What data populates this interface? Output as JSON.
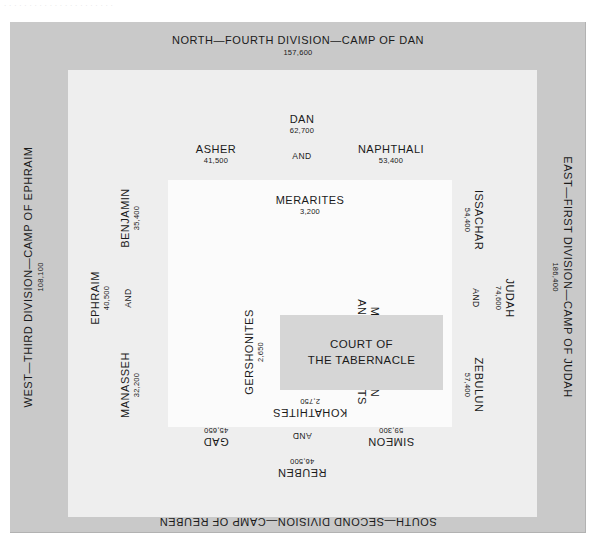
{
  "top_strip_artifact": "· · ·   ·  ·   ·  ·    ·   ·  ·        ·   ·    ·   ·   ·  ·      ·  ·   ·   ·       · ·",
  "divisions": {
    "north": {
      "label": "NORTH—FOURTH DIVISION—CAMP OF DAN",
      "total": "157,600"
    },
    "east": {
      "label": "EAST—FIRST DIVISION—CAMP OF JUDAH",
      "total": "186,400"
    },
    "south": {
      "label": "SOUTH—SECOND DIVISION—CAMP OF REUBEN",
      "total": "151,450"
    },
    "west": {
      "label": "WEST—THIRD DIVISION—CAMP OF EPHRAIM",
      "total": "108,100"
    }
  },
  "tribes": {
    "dan": {
      "name": "DAN",
      "count": "62,700"
    },
    "asher": {
      "name": "ASHER",
      "count": "41,500"
    },
    "naphtali": {
      "name": "NAPHTHALI",
      "count": "53,400"
    },
    "issachar": {
      "name": "ISSACHAR",
      "count": "54,400"
    },
    "judah": {
      "name": "JUDAH",
      "count": "74,600"
    },
    "zebulun": {
      "name": "ZEBULUN",
      "count": "57,400"
    },
    "gad": {
      "name": "GAD",
      "count": "45,650"
    },
    "reuben": {
      "name": "REUBEN",
      "count": "46,500"
    },
    "simeon": {
      "name": "SIMEON",
      "count": "59,300"
    },
    "benjamin": {
      "name": "BENJAMIN",
      "count": "35,400"
    },
    "ephraim": {
      "name": "EPHRAIM",
      "count": "40,500"
    },
    "manasseh": {
      "name": "MANASSEH",
      "count": "32,200"
    }
  },
  "levites": {
    "merarites": {
      "name": "MERARITES",
      "count": "3,200"
    },
    "gershonites": {
      "name": "GERSHONITES",
      "count": "2,650"
    },
    "kohathites": {
      "name": "KOHATHITES",
      "count": "2,750"
    },
    "priests": {
      "line1": "MOSES, AARON",
      "line2": "AND THE PRIESTS"
    }
  },
  "center": {
    "line1": "COURT OF",
    "line2": "THE TABERNACLE"
  },
  "conjunction": "AND",
  "colors": {
    "page_background": "#ffffff",
    "outer_frame": "#c9c9c9",
    "mid_frame": "#eeeeee",
    "inner_frame": "#fbfbfb",
    "court_fill": "#d6d6d6",
    "text": "#1a1a1a"
  }
}
